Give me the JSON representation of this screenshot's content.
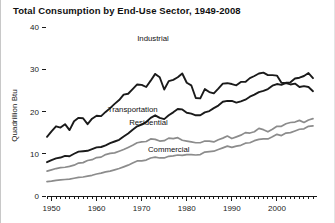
{
  "chart_data": {
    "type": "line",
    "title": "Total Consumption by End-Use Sector, 1949-2008",
    "xlabel": "",
    "ylabel": "Quadrillion Btu",
    "xlim": [
      1949,
      2008
    ],
    "ylim": [
      0,
      40
    ],
    "ytick_values": [
      0,
      10,
      20,
      30,
      40
    ],
    "ytick_labels": [
      "0",
      "10",
      "20",
      "30",
      "40"
    ],
    "xtick_values": [
      1950,
      1960,
      1970,
      1980,
      1990,
      2000
    ],
    "xtick_labels": [
      "1950",
      "1960",
      "1970",
      "1980",
      "1990",
      "2000"
    ],
    "minor_xticks_interval": 1,
    "grid": false,
    "legend": "inline-labels",
    "x": [
      1949,
      1950,
      1951,
      1952,
      1953,
      1954,
      1955,
      1956,
      1957,
      1958,
      1959,
      1960,
      1961,
      1962,
      1963,
      1964,
      1965,
      1966,
      1967,
      1968,
      1969,
      1970,
      1971,
      1972,
      1973,
      1974,
      1975,
      1976,
      1977,
      1978,
      1979,
      1980,
      1981,
      1982,
      1983,
      1984,
      1985,
      1986,
      1987,
      1988,
      1989,
      1990,
      1991,
      1992,
      1993,
      1994,
      1995,
      1996,
      1997,
      1998,
      1999,
      2000,
      2001,
      2002,
      2003,
      2004,
      2005,
      2006,
      2007,
      2008
    ],
    "series": [
      {
        "name": "Industrial",
        "color": "#1a1a1a",
        "width": 1.9,
        "label_x": 1972.5,
        "label_y": 36.6,
        "values": [
          14.0,
          15.3,
          16.5,
          16.2,
          17.0,
          15.6,
          17.7,
          18.5,
          18.4,
          17.0,
          18.3,
          19.0,
          18.9,
          19.9,
          20.8,
          21.8,
          22.7,
          24.0,
          24.2,
          25.3,
          26.4,
          26.3,
          25.8,
          27.3,
          28.9,
          28.1,
          25.2,
          27.2,
          27.5,
          28.1,
          29.0,
          26.8,
          26.2,
          23.2,
          23.1,
          25.3,
          24.6,
          24.3,
          25.4,
          26.6,
          26.7,
          26.5,
          26.2,
          27.0,
          27.0,
          27.9,
          28.4,
          29.0,
          29.2,
          28.6,
          28.6,
          28.5,
          26.8,
          26.7,
          26.4,
          26.6,
          25.8,
          26.0,
          25.8,
          24.8
        ]
      },
      {
        "name": "Transportation",
        "color": "#1a1a1a",
        "width": 1.9,
        "label_x": 1968.0,
        "label_y": 19.8,
        "values": [
          8.0,
          8.5,
          8.9,
          9.1,
          9.5,
          9.4,
          10.0,
          10.5,
          10.6,
          10.7,
          11.1,
          11.5,
          11.6,
          12.0,
          12.5,
          12.9,
          13.3,
          14.1,
          14.8,
          15.7,
          16.5,
          16.9,
          17.5,
          18.5,
          19.1,
          18.5,
          18.2,
          19.1,
          19.8,
          20.6,
          20.5,
          19.7,
          19.5,
          19.1,
          19.1,
          19.8,
          20.1,
          20.8,
          21.4,
          22.3,
          22.5,
          22.5,
          22.1,
          22.4,
          22.8,
          23.5,
          24.0,
          24.6,
          24.9,
          25.3,
          26.1,
          26.5,
          26.3,
          26.8,
          26.9,
          27.8,
          28.0,
          28.4,
          29.1,
          27.9
        ]
      },
      {
        "name": "Residential",
        "color": "#8c8c8c",
        "width": 1.7,
        "label_x": 1971.5,
        "label_y": 16.9,
        "values": [
          5.9,
          6.2,
          6.5,
          6.7,
          6.8,
          7.0,
          7.3,
          7.8,
          7.9,
          8.4,
          8.6,
          9.1,
          9.2,
          9.8,
          10.1,
          10.2,
          10.6,
          11.0,
          11.5,
          12.0,
          12.6,
          12.8,
          12.9,
          13.5,
          13.4,
          13.0,
          13.1,
          13.7,
          13.6,
          13.8,
          13.2,
          13.0,
          12.8,
          12.6,
          12.6,
          13.0,
          13.0,
          12.8,
          13.3,
          13.7,
          14.2,
          13.6,
          14.0,
          14.4,
          15.0,
          14.9,
          15.2,
          16.0,
          15.7,
          15.2,
          15.8,
          16.5,
          16.5,
          17.1,
          17.4,
          17.5,
          17.9,
          17.4,
          18.0,
          18.3
        ]
      },
      {
        "name": "Commercial",
        "color": "#8c8c8c",
        "width": 1.7,
        "label_x": 1976.0,
        "label_y": 10.4,
        "values": [
          3.4,
          3.5,
          3.7,
          3.8,
          3.9,
          4.0,
          4.2,
          4.4,
          4.5,
          4.7,
          4.9,
          5.2,
          5.4,
          5.7,
          5.9,
          6.2,
          6.5,
          6.9,
          7.3,
          7.8,
          8.3,
          8.3,
          8.5,
          9.0,
          9.2,
          9.0,
          9.0,
          9.4,
          9.5,
          9.7,
          9.6,
          9.8,
          9.8,
          9.7,
          9.8,
          10.4,
          10.5,
          10.6,
          11.0,
          11.4,
          11.8,
          11.5,
          11.8,
          12.0,
          12.5,
          12.6,
          13.1,
          13.4,
          13.5,
          13.5,
          14.0,
          14.6,
          14.3,
          14.9,
          15.0,
          15.4,
          15.8,
          15.9,
          16.5,
          16.6
        ]
      }
    ]
  }
}
